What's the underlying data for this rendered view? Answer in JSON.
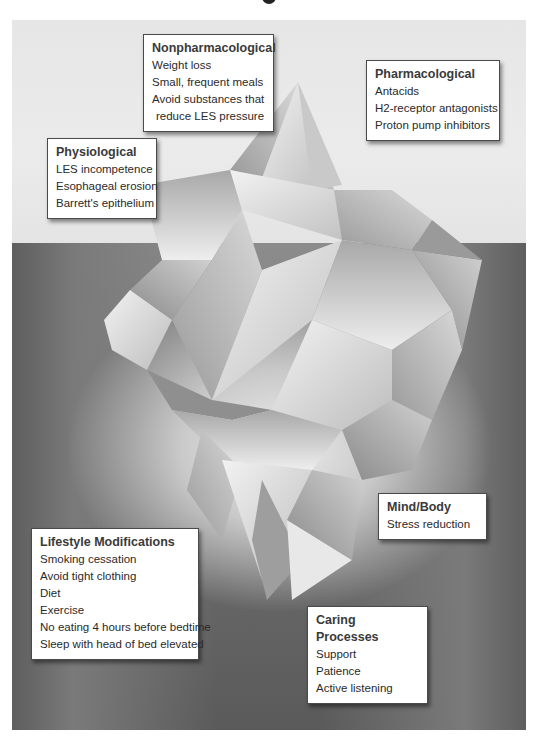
{
  "diagram": {
    "type": "iceberg",
    "colors": {
      "sky": "#e8e8e8",
      "water_light": "#d4d4d4",
      "water_dark": "#5a5a5a",
      "box_background": "#ffffff",
      "box_border": "#4a4a4a",
      "text": "#2a2a2a"
    }
  },
  "boxes": {
    "nonpharmacological": {
      "heading": "Nonpharmacological",
      "items": [
        "Weight loss",
        "Small, frequent meals",
        "Avoid substances that",
        "reduce LES pressure"
      ]
    },
    "pharmacological": {
      "heading": "Pharmacological",
      "items": [
        "Antacids",
        "H2-receptor antagonists",
        "Proton pump inhibitors"
      ]
    },
    "physiological": {
      "heading": "Physiological",
      "items": [
        "LES incompetence",
        "Esophageal erosion",
        "Barrett's epithelium"
      ]
    },
    "mind_body": {
      "heading": "Mind/Body",
      "items": [
        "Stress reduction"
      ]
    },
    "lifestyle": {
      "heading": "Lifestyle Modifications",
      "items": [
        "Smoking cessation",
        "Avoid tight clothing",
        "Diet",
        "Exercise",
        "No eating 4 hours before bedtime",
        "Sleep with head of bed elevated"
      ]
    },
    "caring": {
      "heading": "Caring Processes",
      "items": [
        "Support",
        "Patience",
        "Active listening"
      ]
    }
  }
}
